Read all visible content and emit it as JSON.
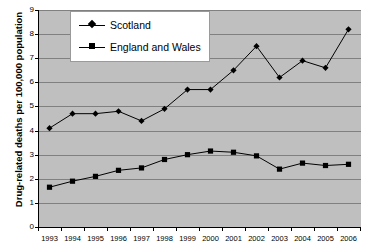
{
  "chart_data": {
    "type": "line",
    "title": "",
    "xlabel": "",
    "ylabel": "Drug-related deaths per 100,000 population",
    "categories": [
      "1993",
      "1994",
      "1995",
      "1996",
      "1997",
      "1998",
      "1999",
      "2000",
      "2001",
      "2002",
      "2003",
      "2004",
      "2005",
      "2006"
    ],
    "ylim": [
      0,
      9
    ],
    "ytick_labels": [
      "0",
      "1",
      "2",
      "3",
      "4",
      "5",
      "6",
      "7",
      "8",
      "9"
    ],
    "ytick_values": [
      0,
      1,
      2,
      3,
      4,
      5,
      6,
      7,
      8,
      9
    ],
    "grid": true,
    "legend_position": "top-left-inside",
    "series": [
      {
        "name": "Scotland",
        "marker": "diamond",
        "color": "#000000",
        "values": [
          4.1,
          4.7,
          4.7,
          4.8,
          4.4,
          4.9,
          5.7,
          5.7,
          6.5,
          7.5,
          6.2,
          6.9,
          6.6,
          8.2
        ]
      },
      {
        "name": "England and Wales",
        "marker": "square",
        "color": "#000000",
        "values": [
          1.65,
          1.9,
          2.1,
          2.35,
          2.45,
          2.8,
          3.0,
          3.15,
          3.1,
          2.95,
          2.4,
          2.65,
          2.55,
          2.6
        ]
      }
    ]
  },
  "legend": {
    "items": [
      {
        "label": "Scotland",
        "marker": "diamond"
      },
      {
        "label": "England and Wales",
        "marker": "square"
      }
    ]
  },
  "axis": {
    "y_title": "Drug-related deaths per 100,000 population"
  },
  "colors": {
    "plot_background": "#bfbfbf",
    "gridline": "#808080",
    "axis": "#000000",
    "series": "#000000",
    "page_background": "#ffffff",
    "legend_background": "#ffffff",
    "legend_border": "#9a9a9a"
  }
}
